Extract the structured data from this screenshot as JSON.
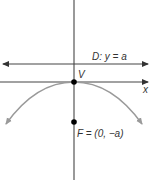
{
  "diagram": {
    "title": "",
    "colors": {
      "axis": "#555555",
      "parabola": "#9a9a9a",
      "text": "#333333",
      "point": "#000000"
    },
    "labels": {
      "x_axis": "x",
      "y_axis": "y",
      "directrix": "D: y = a",
      "vertex": "V",
      "focus": "F = (0, −a)"
    },
    "elements": {
      "directrix": {
        "equation": "y = a",
        "name": "D",
        "pixel_y": 64
      },
      "vertex": {
        "name": "V",
        "coords": "(0, 0)",
        "pixel": [
          74,
          82
        ]
      },
      "focus": {
        "name": "F",
        "coords": "(0, -a)",
        "pixel": [
          74,
          122
        ]
      },
      "parabola": {
        "opens": "down"
      }
    }
  }
}
